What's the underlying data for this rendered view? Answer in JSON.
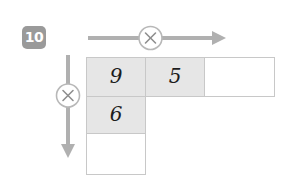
{
  "exercise": {
    "number": "10"
  },
  "operators": {
    "horizontal": {
      "symbol": "×",
      "name": "multiplication",
      "direction": "right"
    },
    "vertical": {
      "symbol": "×",
      "name": "multiplication",
      "direction": "down"
    }
  },
  "grid": {
    "rows": [
      {
        "cells": [
          {
            "value": "9",
            "filled": true,
            "width": "wide"
          },
          {
            "value": "5",
            "filled": true,
            "width": "wide"
          },
          {
            "value": "",
            "filled": false,
            "width": "last"
          }
        ]
      },
      {
        "cells": [
          {
            "value": "6",
            "filled": true,
            "width": "wide"
          }
        ]
      },
      {
        "cells": [
          {
            "value": "",
            "filled": false,
            "width": "wide"
          }
        ]
      }
    ]
  },
  "colors": {
    "badge_bg": "#9a9a9a",
    "badge_text": "#ffffff",
    "cell_filled": "#e6e6e6",
    "cell_empty": "#ffffff",
    "cell_border": "#c8c8c8",
    "arrow": "#b0b0b0",
    "digit": "#1c1c1c"
  }
}
